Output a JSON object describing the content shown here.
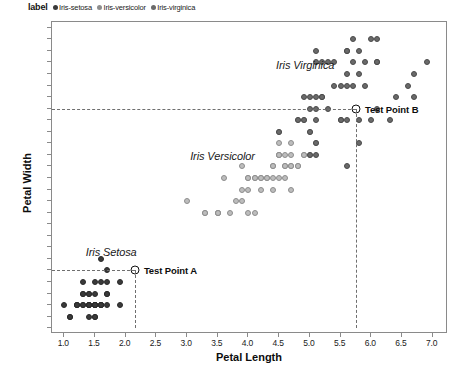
{
  "legend": {
    "title": "label",
    "entries": [
      {
        "label": "Iris-setosa",
        "color": "#3a3a3a"
      },
      {
        "label": "Iris-versicolor",
        "color": "#bdbdbd"
      },
      {
        "label": "Iris-virginica",
        "color": "#6a6a6a"
      }
    ]
  },
  "annotations": {
    "cluster_setosa": "Iris Setosa",
    "cluster_versicolor": "Iris Versicolor",
    "cluster_virginica": "Iris Virginica",
    "test_point_a": "Test Point A",
    "test_point_b": "Test Point B"
  },
  "chart_data": {
    "type": "scatter",
    "title": "",
    "xlabel": "Petal Length",
    "ylabel": "Petal Width",
    "xlim": [
      0.8,
      7.25
    ],
    "ylim": [
      -0.05,
      2.65
    ],
    "grid": false,
    "legend_position": "top-left-outside",
    "xticks": [
      1.0,
      1.5,
      2.0,
      2.5,
      3.0,
      3.5,
      4.0,
      4.5,
      5.0,
      5.5,
      6.0,
      6.5,
      7.0
    ],
    "yticks": [
      0.0,
      0.1,
      0.2,
      0.3,
      0.4,
      0.5,
      0.6,
      0.7,
      0.8,
      0.9,
      1.0,
      1.1,
      1.2,
      1.3,
      1.4,
      1.5,
      1.6,
      1.7,
      1.8,
      1.9,
      2.0,
      2.1,
      2.2,
      2.3,
      2.4,
      2.5,
      2.6
    ],
    "guides": [
      {
        "axis": "y",
        "value": 1.9,
        "style": "dashed",
        "from_x": 0.8,
        "to_x": 5.75
      },
      {
        "axis": "y",
        "value": 0.5,
        "style": "dashed",
        "from_x": 0.8,
        "to_x": 2.15
      },
      {
        "axis": "x",
        "value": 2.15,
        "style": "dashed",
        "from_y": 0.0,
        "to_y": 0.5
      },
      {
        "axis": "x",
        "value": 5.75,
        "style": "dashed",
        "from_y": 0.0,
        "to_y": 1.9
      }
    ],
    "test_points": [
      {
        "name": "Test Point A",
        "x": 2.15,
        "y": 0.5,
        "marker": "open-circle"
      },
      {
        "name": "Test Point B",
        "x": 5.75,
        "y": 1.9,
        "marker": "open-circle"
      }
    ],
    "series": [
      {
        "name": "Iris-setosa",
        "color": "#3a3a3a",
        "points": [
          [
            1.0,
            0.2
          ],
          [
            1.1,
            0.1
          ],
          [
            1.2,
            0.2
          ],
          [
            1.2,
            0.2
          ],
          [
            1.3,
            0.2
          ],
          [
            1.3,
            0.3
          ],
          [
            1.3,
            0.4
          ],
          [
            1.3,
            0.2
          ],
          [
            1.4,
            0.1
          ],
          [
            1.4,
            0.2
          ],
          [
            1.4,
            0.2
          ],
          [
            1.4,
            0.3
          ],
          [
            1.4,
            0.2
          ],
          [
            1.5,
            0.1
          ],
          [
            1.5,
            0.2
          ],
          [
            1.5,
            0.2
          ],
          [
            1.5,
            0.3
          ],
          [
            1.5,
            0.4
          ],
          [
            1.5,
            0.2
          ],
          [
            1.5,
            0.1
          ],
          [
            1.6,
            0.2
          ],
          [
            1.6,
            0.2
          ],
          [
            1.6,
            0.4
          ],
          [
            1.6,
            0.2
          ],
          [
            1.6,
            0.6
          ],
          [
            1.7,
            0.2
          ],
          [
            1.7,
            0.3
          ],
          [
            1.7,
            0.4
          ],
          [
            1.7,
            0.5
          ],
          [
            1.7,
            0.3
          ],
          [
            1.9,
            0.2
          ],
          [
            1.9,
            0.4
          ],
          [
            1.4,
            0.2
          ],
          [
            1.5,
            0.2
          ],
          [
            1.6,
            0.2
          ],
          [
            1.3,
            0.3
          ],
          [
            1.4,
            0.3
          ],
          [
            1.5,
            0.2
          ],
          [
            1.2,
            0.2
          ],
          [
            1.1,
            0.1
          ]
        ]
      },
      {
        "name": "Iris-versicolor",
        "color": "#bdbdbd",
        "points": [
          [
            3.0,
            1.1
          ],
          [
            3.3,
            1.0
          ],
          [
            3.3,
            1.0
          ],
          [
            3.5,
            1.0
          ],
          [
            3.5,
            1.0
          ],
          [
            3.6,
            1.3
          ],
          [
            3.7,
            1.0
          ],
          [
            3.8,
            1.1
          ],
          [
            3.9,
            1.2
          ],
          [
            3.9,
            1.4
          ],
          [
            4.0,
            1.0
          ],
          [
            4.0,
            1.3
          ],
          [
            4.0,
            1.3
          ],
          [
            4.1,
            1.0
          ],
          [
            4.1,
            1.3
          ],
          [
            4.2,
            1.2
          ],
          [
            4.2,
            1.3
          ],
          [
            4.2,
            1.3
          ],
          [
            4.3,
            1.3
          ],
          [
            4.4,
            1.2
          ],
          [
            4.4,
            1.4
          ],
          [
            4.4,
            1.4
          ],
          [
            4.5,
            1.3
          ],
          [
            4.5,
            1.5
          ],
          [
            4.5,
            1.5
          ],
          [
            4.5,
            1.5
          ],
          [
            4.5,
            1.6
          ],
          [
            4.5,
            1.7
          ],
          [
            4.6,
            1.3
          ],
          [
            4.6,
            1.4
          ],
          [
            4.6,
            1.5
          ],
          [
            4.7,
            1.2
          ],
          [
            4.7,
            1.4
          ],
          [
            4.7,
            1.4
          ],
          [
            4.7,
            1.6
          ],
          [
            4.8,
            1.4
          ],
          [
            4.8,
            1.8
          ],
          [
            4.9,
            1.5
          ],
          [
            4.9,
            1.5
          ],
          [
            5.0,
            1.7
          ],
          [
            5.1,
            1.6
          ],
          [
            3.5,
            1.0
          ],
          [
            3.9,
            1.1
          ],
          [
            4.0,
            1.2
          ],
          [
            4.1,
            1.3
          ],
          [
            4.3,
            1.3
          ],
          [
            4.4,
            1.3
          ],
          [
            4.6,
            1.4
          ],
          [
            4.7,
            1.5
          ],
          [
            4.8,
            1.4
          ],
          [
            4.9,
            1.8
          ],
          [
            5.0,
            1.5
          ]
        ]
      },
      {
        "name": "Iris-virginica",
        "color": "#6a6a6a",
        "points": [
          [
            4.5,
            1.7
          ],
          [
            4.8,
            1.8
          ],
          [
            4.9,
            1.8
          ],
          [
            4.9,
            2.0
          ],
          [
            5.0,
            1.5
          ],
          [
            5.0,
            1.7
          ],
          [
            5.0,
            1.9
          ],
          [
            5.1,
            1.5
          ],
          [
            5.1,
            1.6
          ],
          [
            5.1,
            1.8
          ],
          [
            5.1,
            1.9
          ],
          [
            5.1,
            2.0
          ],
          [
            5.1,
            2.3
          ],
          [
            5.2,
            2.0
          ],
          [
            5.2,
            2.3
          ],
          [
            5.3,
            1.9
          ],
          [
            5.3,
            2.3
          ],
          [
            5.4,
            2.1
          ],
          [
            5.4,
            2.3
          ],
          [
            5.5,
            1.8
          ],
          [
            5.5,
            2.1
          ],
          [
            5.6,
            1.4
          ],
          [
            5.6,
            1.8
          ],
          [
            5.6,
            2.1
          ],
          [
            5.6,
            2.2
          ],
          [
            5.6,
            2.4
          ],
          [
            5.7,
            2.1
          ],
          [
            5.7,
            2.3
          ],
          [
            5.7,
            2.5
          ],
          [
            5.8,
            1.6
          ],
          [
            5.8,
            1.8
          ],
          [
            5.8,
            2.2
          ],
          [
            5.9,
            2.1
          ],
          [
            5.9,
            2.3
          ],
          [
            6.0,
            1.8
          ],
          [
            6.0,
            2.5
          ],
          [
            6.1,
            1.9
          ],
          [
            6.1,
            2.3
          ],
          [
            6.1,
            2.5
          ],
          [
            6.3,
            1.8
          ],
          [
            6.4,
            2.0
          ],
          [
            6.6,
            2.1
          ],
          [
            6.7,
            2.0
          ],
          [
            6.7,
            2.2
          ],
          [
            6.9,
            2.3
          ],
          [
            5.0,
            2.0
          ],
          [
            5.1,
            2.4
          ],
          [
            5.2,
            2.0
          ],
          [
            5.5,
            1.8
          ],
          [
            5.6,
            2.4
          ],
          [
            5.8,
            2.4
          ],
          [
            6.1,
            2.3
          ]
        ]
      }
    ]
  }
}
